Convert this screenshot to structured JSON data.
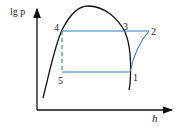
{
  "diagram": {
    "type": "lgp-h refrigeration cycle diagram",
    "y_axis_label": "lg p",
    "x_axis_label": "h",
    "points": [
      {
        "id": "1",
        "label": "1"
      },
      {
        "id": "2",
        "label": "2"
      },
      {
        "id": "3",
        "label": "3"
      },
      {
        "id": "4",
        "label": "4"
      },
      {
        "id": "5",
        "label": "5"
      }
    ],
    "colors": {
      "axes": "#111111",
      "saturation_curve": "#111111",
      "cycle": "#2f7fc1"
    }
  }
}
